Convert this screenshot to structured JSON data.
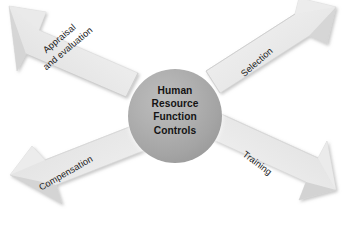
{
  "diagram": {
    "type": "four-arrow-radial-hub",
    "title": "Human Resource Function Controls",
    "background_color": "#ffffff",
    "hub": {
      "name": "hub-circle",
      "lines": [
        "Human",
        "Resource",
        "Function",
        "Controls"
      ],
      "fill_color": "#a9a9a9",
      "text_color": "#141414",
      "center_x": 175,
      "center_y": 116,
      "radius": 47
    },
    "arrows": [
      {
        "id": "appraisal",
        "lines": [
          "Appraisal",
          "and evaluation"
        ],
        "direction": "up-left",
        "rotation_deg": -40,
        "fill_color": "#e6e6e6",
        "shade_color": "#c9c9c9",
        "text_color": "#1a1a1a"
      },
      {
        "id": "selection",
        "lines": [
          "Selection"
        ],
        "direction": "up-right",
        "rotation_deg": -41,
        "fill_color": "#e6e6e6",
        "shade_color": "#c9c9c9",
        "text_color": "#1a1a1a"
      },
      {
        "id": "compensation",
        "lines": [
          "Compensation"
        ],
        "direction": "down-left",
        "rotation_deg": -30,
        "fill_color": "#e6e6e6",
        "shade_color": "#c9c9c9",
        "text_color": "#1a1a1a"
      },
      {
        "id": "training",
        "lines": [
          "Training"
        ],
        "direction": "down-right",
        "rotation_deg": 37,
        "fill_color": "#e6e6e6",
        "shade_color": "#c9c9c9",
        "text_color": "#1a1a1a"
      }
    ]
  }
}
